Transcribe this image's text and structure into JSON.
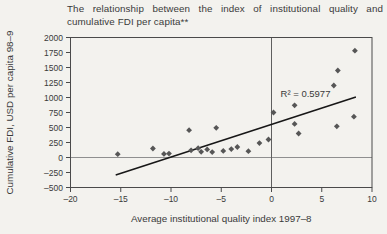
{
  "figure": {
    "title_line1": "The relationship between the index of institutional quality and",
    "title_line2": "cumulative FDI per capita**"
  },
  "chart_data": {
    "type": "scatter",
    "title": "The relationship between the index of institutional quality and cumulative FDI per capita**",
    "xlabel": "Average institutional quality index 1997–8",
    "ylabel": "Cumulative FDI, USD per capita 98–9",
    "xlim": [
      -20,
      10
    ],
    "ylim": [
      -500,
      2000
    ],
    "grid": false,
    "legend": "none",
    "x_ticks": [
      {
        "v": -20,
        "label": "–20"
      },
      {
        "v": -15,
        "label": "–15"
      },
      {
        "v": -10,
        "label": "–10"
      },
      {
        "v": -5,
        "label": "–5"
      },
      {
        "v": 0,
        "label": "0"
      },
      {
        "v": 5,
        "label": "5"
      },
      {
        "v": 10,
        "label": "10"
      }
    ],
    "y_ticks": [
      {
        "v": -500,
        "label": "–500"
      },
      {
        "v": -250,
        "label": "–250"
      },
      {
        "v": 0,
        "label": "0"
      },
      {
        "v": 250,
        "label": "250"
      },
      {
        "v": 500,
        "label": "500"
      },
      {
        "v": 750,
        "label": "750"
      },
      {
        "v": 1000,
        "label": "1000"
      },
      {
        "v": 1250,
        "label": "1250"
      },
      {
        "v": 1500,
        "label": "1500"
      },
      {
        "v": 1750,
        "label": "1750"
      },
      {
        "v": 2000,
        "label": "2000"
      }
    ],
    "reference_lines": {
      "vertical_at_x": 0,
      "horizontal_at_y": 0
    },
    "points": [
      [
        -15.3,
        55
      ],
      [
        -11.8,
        150
      ],
      [
        -10.7,
        60
      ],
      [
        -10.2,
        65
      ],
      [
        -8.2,
        455
      ],
      [
        -8.0,
        120
      ],
      [
        -7.3,
        155
      ],
      [
        -7.0,
        95
      ],
      [
        -6.4,
        135
      ],
      [
        -5.9,
        90
      ],
      [
        -5.5,
        495
      ],
      [
        -4.8,
        110
      ],
      [
        -4.0,
        140
      ],
      [
        -3.4,
        175
      ],
      [
        -2.3,
        105
      ],
      [
        -1.2,
        240
      ],
      [
        -0.3,
        300
      ],
      [
        0.2,
        750
      ],
      [
        2.3,
        870
      ],
      [
        2.3,
        560
      ],
      [
        2.7,
        400
      ],
      [
        6.2,
        1200
      ],
      [
        6.6,
        1450
      ],
      [
        6.5,
        520
      ],
      [
        8.2,
        680
      ],
      [
        8.3,
        1780
      ]
    ],
    "trendline": {
      "x1": -15.5,
      "y1": -290,
      "x2": 8.4,
      "y2": 1010,
      "r_squared": 0.5977
    },
    "annotation": {
      "text": "R² = 0.5977",
      "x": 0.9,
      "y": 1010
    }
  },
  "colors": {
    "background": "#f3f2ee",
    "text": "#3a3a3a",
    "frame": "#4a4a4a",
    "zero_line_horizontal": "#8f8f8f",
    "zero_line_vertical": "#5f5f5f",
    "point_fill": "#565656",
    "trend_line": "#171717"
  }
}
